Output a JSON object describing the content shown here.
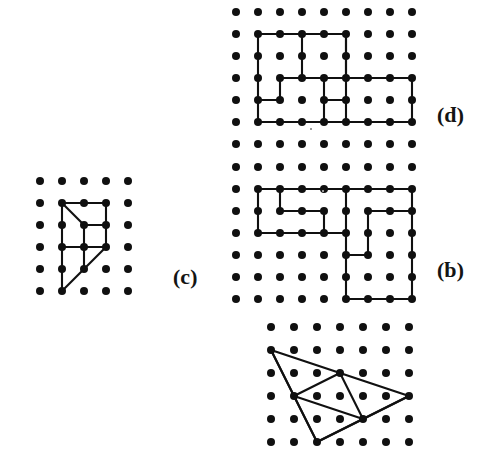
{
  "figure": {
    "background_color": "#ffffff",
    "ink_color": "#101010",
    "width": 501,
    "height": 453,
    "orientation_note": "page scanned upside-down; panel labels render rotated 180 degrees"
  },
  "panels": [
    {
      "id": "p",
      "label": "(p)",
      "label_x": 437,
      "label_y": 108,
      "grid": {
        "origin_x": 236,
        "origin_y": 12,
        "spacing": 22,
        "cols": 9,
        "rows": 7,
        "dot_radius": 4.0
      },
      "polygon_closed": true,
      "vertices": [
        [
          1,
          1
        ],
        [
          5,
          1
        ],
        [
          5,
          3
        ],
        [
          8,
          3
        ],
        [
          8,
          5
        ],
        [
          1,
          5
        ]
      ],
      "inner_paths": [
        {
          "closed": false,
          "points": [
            [
              3,
              1
            ],
            [
              3,
              3
            ]
          ]
        },
        {
          "closed": false,
          "points": [
            [
              2,
              3
            ],
            [
              2,
              4
            ],
            [
              1,
              4
            ]
          ]
        },
        {
          "closed": false,
          "points": [
            [
              2,
              3
            ],
            [
              5,
              3
            ]
          ]
        },
        {
          "closed": false,
          "points": [
            [
              4,
              3
            ],
            [
              4,
              4
            ],
            [
              5,
              4
            ]
          ]
        },
        {
          "closed": false,
          "points": [
            [
              5,
              1
            ],
            [
              5,
              5
            ]
          ]
        },
        {
          "closed": false,
          "points": [
            [
              4,
              4
            ],
            [
              4,
              5
            ]
          ]
        }
      ]
    },
    {
      "id": "q",
      "label": "(q)",
      "label_x": 437,
      "label_y": 263,
      "grid": {
        "origin_x": 236,
        "origin_y": 167,
        "spacing": 22,
        "cols": 9,
        "rows": 7,
        "dot_radius": 4.0
      },
      "polygon_closed": false,
      "vertices": [],
      "inner_paths": [
        {
          "closed": false,
          "points": [
            [
              1,
              1
            ],
            [
              8,
              1
            ]
          ]
        },
        {
          "closed": false,
          "points": [
            [
              1,
              1
            ],
            [
              1,
              3
            ]
          ]
        },
        {
          "closed": false,
          "points": [
            [
              1,
              3
            ],
            [
              5,
              3
            ]
          ]
        },
        {
          "closed": false,
          "points": [
            [
              2,
              1
            ],
            [
              2,
              2
            ]
          ]
        },
        {
          "closed": false,
          "points": [
            [
              2,
              2
            ],
            [
              4,
              2
            ]
          ]
        },
        {
          "closed": false,
          "points": [
            [
              4,
              2
            ],
            [
              4,
              3
            ]
          ]
        },
        {
          "closed": false,
          "points": [
            [
              5,
              1
            ],
            [
              5,
              6
            ]
          ]
        },
        {
          "closed": false,
          "points": [
            [
              8,
              1
            ],
            [
              8,
              6
            ]
          ]
        },
        {
          "closed": false,
          "points": [
            [
              5,
              6
            ],
            [
              8,
              6
            ]
          ]
        },
        {
          "closed": false,
          "points": [
            [
              6,
              2
            ],
            [
              8,
              2
            ]
          ]
        },
        {
          "closed": false,
          "points": [
            [
              6,
              2
            ],
            [
              6,
              4
            ]
          ]
        },
        {
          "closed": false,
          "points": [
            [
              5,
              4
            ],
            [
              6,
              4
            ]
          ]
        }
      ]
    },
    {
      "id": "c",
      "label": "(ɔ)",
      "label_x": 173,
      "label_y": 270,
      "grid": {
        "origin_x": 40,
        "origin_y": 181,
        "spacing": 22,
        "cols": 5,
        "rows": 6,
        "dot_radius": 4.0
      },
      "polygon_closed": false,
      "vertices": [],
      "inner_paths": [
        {
          "closed": false,
          "points": [
            [
              1,
              1
            ],
            [
              3,
              1
            ]
          ]
        },
        {
          "closed": false,
          "points": [
            [
              1,
              1
            ],
            [
              1,
              4
            ]
          ]
        },
        {
          "closed": false,
          "points": [
            [
              3,
              1
            ],
            [
              3,
              3
            ]
          ]
        },
        {
          "closed": false,
          "points": [
            [
              1,
              1
            ],
            [
              2,
              2
            ]
          ]
        },
        {
          "closed": false,
          "points": [
            [
              2,
              2
            ],
            [
              3,
              2
            ]
          ]
        },
        {
          "closed": false,
          "points": [
            [
              2,
              2
            ],
            [
              2,
              4
            ]
          ]
        },
        {
          "closed": false,
          "points": [
            [
              1,
              3
            ],
            [
              3,
              3
            ]
          ]
        },
        {
          "closed": false,
          "points": [
            [
              3,
              3
            ],
            [
              2,
              4
            ]
          ]
        },
        {
          "closed": false,
          "points": [
            [
              1,
              4
            ],
            [
              1,
              5
            ]
          ]
        },
        {
          "closed": false,
          "points": [
            [
              1,
              5
            ],
            [
              2,
              4
            ]
          ]
        }
      ]
    },
    {
      "id": "bottom",
      "label": "",
      "label_x": 0,
      "label_y": 0,
      "grid": {
        "origin_x": 271,
        "origin_y": 327,
        "spacing": 23,
        "cols": 7,
        "rows": 6,
        "dot_radius": 4.0
      },
      "polygon_closed": false,
      "vertices": [],
      "inner_paths": [
        {
          "closed": true,
          "points": [
            [
              0,
              1
            ],
            [
              3,
              2
            ],
            [
              6,
              3
            ],
            [
              2,
              5
            ]
          ]
        },
        {
          "closed": false,
          "points": [
            [
              0,
              1
            ],
            [
              1,
              3
            ]
          ]
        },
        {
          "closed": false,
          "points": [
            [
              1,
              3
            ],
            [
              3,
              2
            ]
          ]
        },
        {
          "closed": false,
          "points": [
            [
              1,
              3
            ],
            [
              4,
              4
            ]
          ]
        },
        {
          "closed": false,
          "points": [
            [
              3,
              2
            ],
            [
              4,
              4
            ]
          ]
        },
        {
          "closed": false,
          "points": [
            [
              1,
              3
            ],
            [
              2,
              5
            ]
          ]
        },
        {
          "closed": false,
          "points": [
            [
              4,
              4
            ],
            [
              2,
              5
            ]
          ]
        },
        {
          "closed": false,
          "points": [
            [
              4,
              4
            ],
            [
              6,
              3
            ]
          ]
        }
      ]
    }
  ],
  "specks": [
    {
      "x": 310,
      "y": 128
    },
    {
      "x": 322,
      "y": 190
    }
  ]
}
